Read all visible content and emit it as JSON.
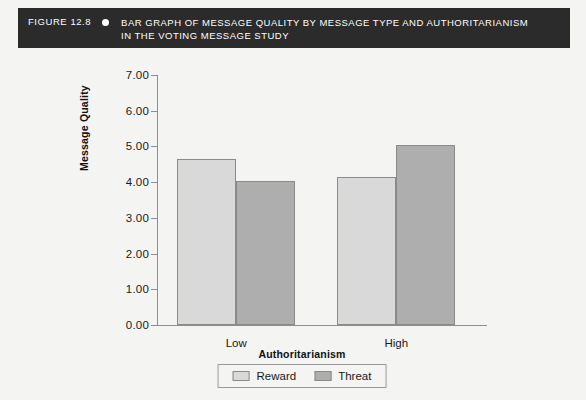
{
  "caption": {
    "figure_number": "FIGURE 12.8",
    "bullet_icon": "bullet-dot-icon",
    "line1": "BAR GRAPH OF MESSAGE QUALITY BY MESSAGE TYPE AND AUTHORITARIANISM",
    "line2": "IN THE VOTING MESSAGE STUDY"
  },
  "colors": {
    "caption_bar": "#2b2b2b",
    "page_background": "#f4f4f2",
    "reward_bar": "#d9d9d9",
    "threat_bar": "#aeaeae",
    "axis": "#8d8d8d"
  },
  "chart_data": {
    "type": "bar",
    "title": "",
    "categories": [
      "Low",
      "High"
    ],
    "series": [
      {
        "name": "Reward",
        "values": [
          4.64,
          4.15
        ],
        "color": "#d9d9d9"
      },
      {
        "name": "Threat",
        "values": [
          4.02,
          5.05
        ],
        "color": "#aeaeae"
      }
    ],
    "xlabel": "Authoritarianism",
    "ylabel": "Message Quality",
    "ylim": [
      0.0,
      7.0
    ],
    "ytick_values": [
      0.0,
      1.0,
      2.0,
      3.0,
      4.0,
      5.0,
      6.0,
      7.0
    ],
    "ytick_labels": [
      "0.00",
      "1.00",
      "2.00",
      "3.00",
      "4.00",
      "5.00",
      "6.00",
      "7.00"
    ],
    "grid": false,
    "legend_position": "bottom-center",
    "legend_entries": [
      "Reward",
      "Threat"
    ]
  }
}
